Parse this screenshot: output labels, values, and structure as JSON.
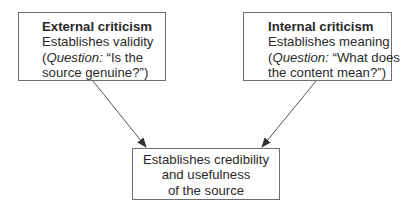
{
  "diagram": {
    "type": "flow",
    "nodes": [
      {
        "id": "external",
        "title": "External criticism",
        "lines": [
          "Establishes validity"
        ],
        "question_label": "Question:",
        "question_text_1": " “Is the",
        "question_text_2": "source genuine?”)"
      },
      {
        "id": "internal",
        "title": "Internal criticism",
        "lines": [
          "Establishes meaning"
        ],
        "question_label": "Question:",
        "question_text_1": " “What does",
        "question_text_2": "the content mean?”)"
      },
      {
        "id": "result",
        "lines": [
          "Establishes credibility",
          "and usefulness",
          "of the source"
        ]
      }
    ],
    "edges": [
      {
        "from": "external",
        "to": "result"
      },
      {
        "from": "internal",
        "to": "result"
      }
    ],
    "colors": {
      "border": "#6e6e6e",
      "text": "#2a2a2a",
      "arrow": "#555555",
      "background": "#ffffff"
    }
  }
}
